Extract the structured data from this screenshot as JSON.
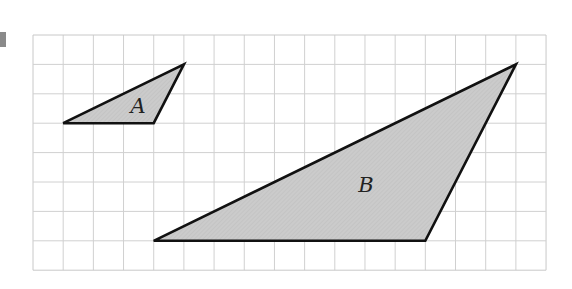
{
  "figure": {
    "grid": {
      "x0": 33,
      "y0": 35,
      "cols": 17,
      "rows": 8,
      "cell_w": 30.18,
      "cell_h": 29.4,
      "line_color": "#d0d0d0",
      "border_color": "#c8c8c8"
    },
    "shapes": [
      {
        "label": "A",
        "vertices_grid": [
          [
            1,
            3
          ],
          [
            4,
            3
          ],
          [
            5,
            1
          ]
        ],
        "label_pos": [
          138,
          113
        ],
        "fill": "#c9c9c9",
        "stroke": "#111111"
      },
      {
        "label": "B",
        "vertices_grid": [
          [
            4,
            7
          ],
          [
            13,
            7
          ],
          [
            16,
            1
          ]
        ],
        "label_pos": [
          366,
          192
        ],
        "fill": "#c9c9c9",
        "stroke": "#111111"
      }
    ]
  }
}
